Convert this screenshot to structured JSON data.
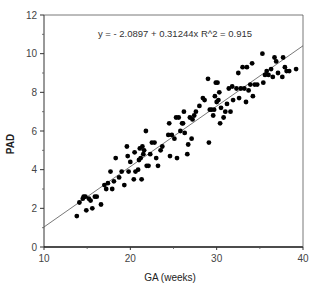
{
  "chart_data": {
    "type": "scatter",
    "title": "",
    "annotation": "y =  - 2.0897 + 0.31244x   R^2 = 0.915",
    "xlabel": "GA  (weeks)",
    "ylabel": "PAD",
    "xlim": [
      10,
      40
    ],
    "ylim": [
      0,
      12
    ],
    "xticks": [
      10,
      20,
      30,
      40
    ],
    "yticks": [
      0,
      2,
      4,
      6,
      8,
      10,
      12
    ],
    "grid": false,
    "legend": null,
    "regression": {
      "intercept": -2.0897,
      "slope": 0.31244,
      "r2": 0.915
    },
    "series": [
      {
        "name": "PAD vs GA",
        "points": [
          [
            13.8,
            1.6
          ],
          [
            14.1,
            2.3
          ],
          [
            14.5,
            2.5
          ],
          [
            14.6,
            2.6
          ],
          [
            14.8,
            2.6
          ],
          [
            14.9,
            1.9
          ],
          [
            15.2,
            2.5
          ],
          [
            15.4,
            2.4
          ],
          [
            15.6,
            2.0
          ],
          [
            15.9,
            2.6
          ],
          [
            16.1,
            2.6
          ],
          [
            16.6,
            2.2
          ],
          [
            17.0,
            3.2
          ],
          [
            17.2,
            3.0
          ],
          [
            17.4,
            3.3
          ],
          [
            17.7,
            3.9
          ],
          [
            17.9,
            3.0
          ],
          [
            18.1,
            3.4
          ],
          [
            18.3,
            4.6
          ],
          [
            18.7,
            3.6
          ],
          [
            19.0,
            3.9
          ],
          [
            19.3,
            3.2
          ],
          [
            19.6,
            5.2
          ],
          [
            19.7,
            4.7
          ],
          [
            19.8,
            3.9
          ],
          [
            20.0,
            4.4
          ],
          [
            20.4,
            3.5
          ],
          [
            20.5,
            4.9
          ],
          [
            20.6,
            3.9
          ],
          [
            20.9,
            4.0
          ],
          [
            21.0,
            4.5
          ],
          [
            21.1,
            5.1
          ],
          [
            21.2,
            4.6
          ],
          [
            21.3,
            3.5
          ],
          [
            21.4,
            5.2
          ],
          [
            21.5,
            4.8
          ],
          [
            21.6,
            5.0
          ],
          [
            21.8,
            6.0
          ],
          [
            21.9,
            4.2
          ],
          [
            22.1,
            4.2
          ],
          [
            22.3,
            4.8
          ],
          [
            22.5,
            5.4
          ],
          [
            22.8,
            5.4
          ],
          [
            23.0,
            4.6
          ],
          [
            23.2,
            4.2
          ],
          [
            23.5,
            5.0
          ],
          [
            23.7,
            5.2
          ],
          [
            24.4,
            5.8
          ],
          [
            24.5,
            6.4
          ],
          [
            24.6,
            4.7
          ],
          [
            24.8,
            5.8
          ],
          [
            25.1,
            5.6
          ],
          [
            25.3,
            6.7
          ],
          [
            25.4,
            4.6
          ],
          [
            25.6,
            6.7
          ],
          [
            25.8,
            6.0
          ],
          [
            26.0,
            6.4
          ],
          [
            26.1,
            6.4
          ],
          [
            26.2,
            7.0
          ],
          [
            26.3,
            5.9
          ],
          [
            26.6,
            4.8
          ],
          [
            26.7,
            5.3
          ],
          [
            26.9,
            6.7
          ],
          [
            27.1,
            5.6
          ],
          [
            27.2,
            6.6
          ],
          [
            27.4,
            6.8
          ],
          [
            27.6,
            7.0
          ],
          [
            28.0,
            7.3
          ],
          [
            28.4,
            7.7
          ],
          [
            28.6,
            7.6
          ],
          [
            29.0,
            8.7
          ],
          [
            29.1,
            5.4
          ],
          [
            29.2,
            7.1
          ],
          [
            29.4,
            7.1
          ],
          [
            29.6,
            6.8
          ],
          [
            29.7,
            7.1
          ],
          [
            29.8,
            7.8
          ],
          [
            29.9,
            8.5
          ],
          [
            30.0,
            7.5
          ],
          [
            30.1,
            8.5
          ],
          [
            30.2,
            7.6
          ],
          [
            30.3,
            8.0
          ],
          [
            30.4,
            6.4
          ],
          [
            30.5,
            7.2
          ],
          [
            30.8,
            6.7
          ],
          [
            31.0,
            7.0
          ],
          [
            31.2,
            7.4
          ],
          [
            31.4,
            8.2
          ],
          [
            31.6,
            7.0
          ],
          [
            31.8,
            8.3
          ],
          [
            31.9,
            7.6
          ],
          [
            32.3,
            8.2
          ],
          [
            32.5,
            9.0
          ],
          [
            32.6,
            7.7
          ],
          [
            32.8,
            8.2
          ],
          [
            33.0,
            9.3
          ],
          [
            33.2,
            8.2
          ],
          [
            33.4,
            7.5
          ],
          [
            33.5,
            9.3
          ],
          [
            33.7,
            8.1
          ],
          [
            33.9,
            8.4
          ],
          [
            34.1,
            9.5
          ],
          [
            34.2,
            7.8
          ],
          [
            34.4,
            8.4
          ],
          [
            34.7,
            8.4
          ],
          [
            35.3,
            10.0
          ],
          [
            35.4,
            8.5
          ],
          [
            35.6,
            8.9
          ],
          [
            35.8,
            9.1
          ],
          [
            36.0,
            8.9
          ],
          [
            36.3,
            9.2
          ],
          [
            36.5,
            8.8
          ],
          [
            36.7,
            9.8
          ],
          [
            36.9,
            9.6
          ],
          [
            37.1,
            9.0
          ],
          [
            37.6,
            8.8
          ],
          [
            37.7,
            9.8
          ],
          [
            37.9,
            9.3
          ],
          [
            38.1,
            9.1
          ],
          [
            38.4,
            9.1
          ],
          [
            39.2,
            9.2
          ]
        ]
      }
    ]
  }
}
